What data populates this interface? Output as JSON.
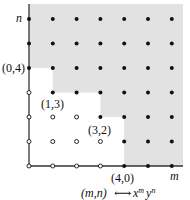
{
  "diagram": {
    "axes": {
      "x_label": "m",
      "y_label": "n"
    },
    "generators": [
      {
        "m": 0,
        "n": 4,
        "label": "(0,4)"
      },
      {
        "m": 1,
        "n": 3,
        "label": "(1,3)"
      },
      {
        "m": 3,
        "n": 2,
        "label": "(3,2)"
      },
      {
        "m": 4,
        "n": 0,
        "label": "(4,0)"
      }
    ],
    "caption": {
      "left": "(m,n)",
      "arrow": "⟷",
      "right_base1": "x",
      "right_sup1": "m",
      "right_base2": "y",
      "right_sup2": "n"
    },
    "grid": {
      "cols": 7,
      "rows": 7
    },
    "colors": {
      "shade": "#e2e2e2",
      "dot": "#111111",
      "axis": "#333333"
    }
  }
}
